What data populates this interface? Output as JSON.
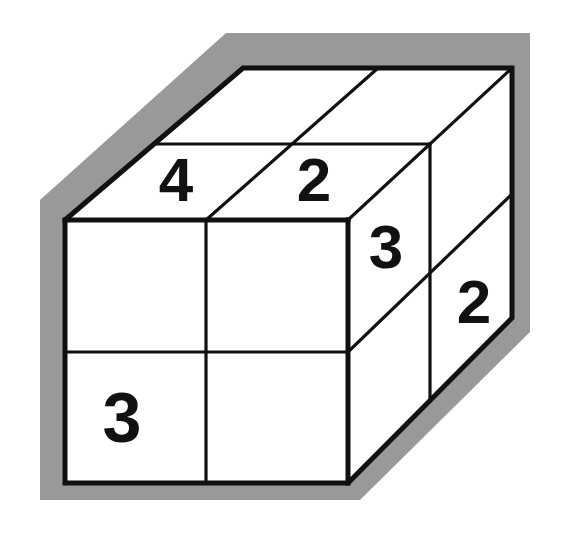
{
  "figure": {
    "kind": "geometry-diagram",
    "background_color": "#ffffff",
    "outline_color": "#111111",
    "shadow_color": "#999999",
    "face_fill_color": "#ffffff",
    "number_color": "#111111",
    "stroke_width_outline": 5,
    "stroke_width_grid": 3.2
  },
  "faces": {
    "top": {
      "name": "top-face",
      "rows": 2,
      "cols": 2,
      "cells": [
        {
          "id": "top-back-left",
          "label": ""
        },
        {
          "id": "top-back-right",
          "label": ""
        },
        {
          "id": "top-front-left",
          "label": "4"
        },
        {
          "id": "top-front-right",
          "label": "2"
        }
      ]
    },
    "front": {
      "name": "front-face",
      "rows": 2,
      "cols": 2,
      "cells": [
        {
          "id": "front-top-left",
          "label": ""
        },
        {
          "id": "front-top-right",
          "label": ""
        },
        {
          "id": "front-bottom-left",
          "label": "3"
        },
        {
          "id": "front-bottom-right",
          "label": ""
        }
      ]
    },
    "right": {
      "name": "right-face",
      "rows": 2,
      "cols": 2,
      "cells": [
        {
          "id": "right-top-front",
          "label": "3"
        },
        {
          "id": "right-top-back",
          "label": "2"
        },
        {
          "id": "right-bottom-front",
          "label": ""
        },
        {
          "id": "right-bottom-back",
          "label": ""
        }
      ]
    }
  },
  "labels": {
    "top_front_left": "4",
    "top_front_right": "2",
    "right_top_front": "3",
    "right_top_back": "2",
    "front_bottom_left": "3"
  }
}
